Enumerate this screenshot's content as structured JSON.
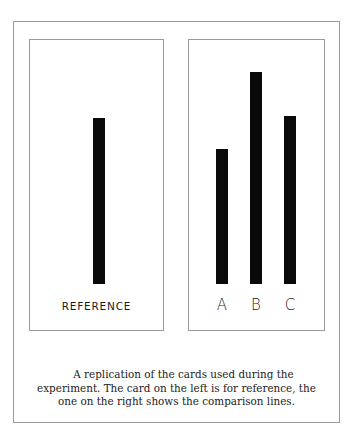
{
  "figure": {
    "reference_card": {
      "label": "REFERENCE",
      "line": {
        "top": 118,
        "bottom": 284,
        "length_px": 166
      }
    },
    "comparison_card": {
      "lines": [
        {
          "label": "A",
          "top": 149,
          "bottom": 284,
          "length_px": 135
        },
        {
          "label": "B",
          "top": 72,
          "bottom": 284,
          "length_px": 212
        },
        {
          "label": "C",
          "top": 116,
          "bottom": 284,
          "length_px": 168
        }
      ]
    },
    "caption": {
      "line1": "A replication of the cards used during the",
      "line2": "experiment. The card on the left is for reference, the",
      "line3": "one on the right shows the comparison lines."
    }
  },
  "colors": {
    "line": "#0a0a0a",
    "border": "#9a9a9a",
    "background": "#ffffff"
  }
}
